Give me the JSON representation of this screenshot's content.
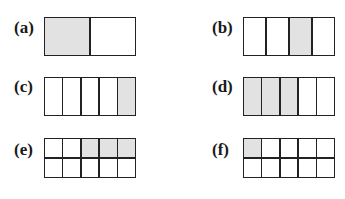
{
  "figures": [
    {
      "label": "(a)",
      "rows": 1,
      "cols": 2,
      "shaded": [
        [
          0,
          0
        ]
      ]
    },
    {
      "label": "(b)",
      "rows": 1,
      "cols": 4,
      "shaded": [
        [
          0,
          2
        ]
      ]
    },
    {
      "label": "(c)",
      "rows": 1,
      "cols": 5,
      "shaded": [
        [
          0,
          4
        ]
      ]
    },
    {
      "label": "(d)",
      "rows": 1,
      "cols": 5,
      "shaded": [
        [
          0,
          0
        ],
        [
          0,
          1
        ],
        [
          0,
          2
        ]
      ]
    },
    {
      "label": "(e)",
      "rows": 2,
      "cols": 5,
      "shaded": [
        [
          0,
          2
        ],
        [
          0,
          3
        ],
        [
          0,
          4
        ]
      ]
    },
    {
      "label": "(f)",
      "rows": 2,
      "cols": 5,
      "shaded": [
        [
          0,
          0
        ]
      ]
    }
  ],
  "colors": {
    "shade": "#e2e2e2",
    "line": "#222222",
    "background": "#ffffff"
  }
}
